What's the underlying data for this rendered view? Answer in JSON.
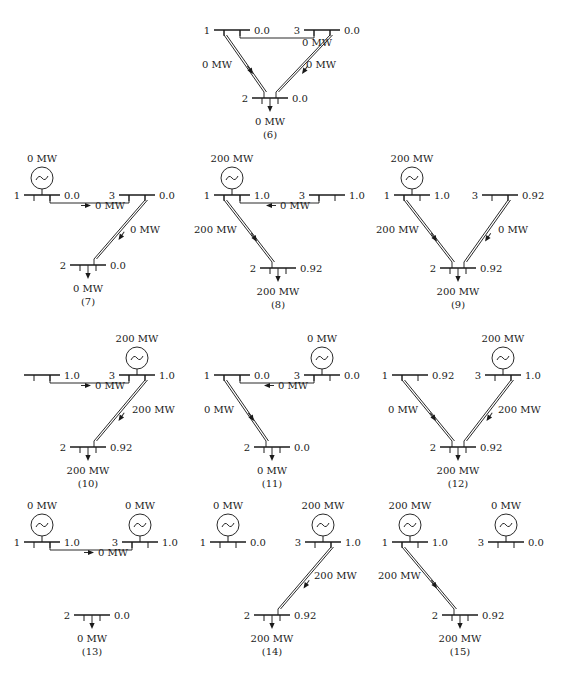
{
  "figure": {
    "colors": {
      "ink": "#1a1a1a",
      "background": "#ffffff"
    },
    "unit": "MW",
    "diagrams": [
      {
        "id": "6",
        "caption": "(6)",
        "origin": [
          190,
          0
        ],
        "buses": {
          "1": {
            "label": "1",
            "x": 42,
            "y": 30,
            "value": "0.0",
            "gen": null
          },
          "3": {
            "label": "3",
            "x": 132,
            "y": 30,
            "value": "0.0",
            "gen": null
          },
          "2": {
            "label": "2",
            "x": 80,
            "y": 98,
            "value": "0.0",
            "gen": null
          }
        },
        "load": "0 MW",
        "lines": [
          {
            "from": "1",
            "to": "3",
            "flow": "0 MW",
            "arrow": "none",
            "label_pos": [
              112,
              46
            ]
          },
          {
            "from": "1",
            "to": "2",
            "flow": "0 MW",
            "arrow": "down-right",
            "label_pos": [
              12,
              68
            ]
          },
          {
            "from": "3",
            "to": "2",
            "flow": "0 MW",
            "arrow": "down-left",
            "label_pos": [
              116,
              68
            ]
          }
        ]
      },
      {
        "id": "7",
        "caption": "(7)",
        "origin": [
          0,
          140
        ],
        "buses": {
          "1": {
            "label": "1",
            "x": 42,
            "y": 55,
            "value": "0.0",
            "gen": "0 MW"
          },
          "3": {
            "label": "3",
            "x": 137,
            "y": 55,
            "value": "0.0",
            "gen": null
          },
          "2": {
            "label": "2",
            "x": 88,
            "y": 125,
            "value": "0.0",
            "gen": null
          }
        },
        "load": "0 MW",
        "lines": [
          {
            "from": "1",
            "to": "3",
            "flow": "0 MW",
            "arrow": "right",
            "label_pos": [
              95,
              69
            ]
          },
          {
            "from": "3",
            "to": "2",
            "flow": "0 MW",
            "arrow": "down-left",
            "label_pos": [
              130,
              93
            ]
          }
        ]
      },
      {
        "id": "8",
        "caption": "(8)",
        "origin": [
          190,
          140
        ],
        "buses": {
          "1": {
            "label": "1",
            "x": 42,
            "y": 55,
            "value": "1.0",
            "gen": "200 MW"
          },
          "3": {
            "label": "3",
            "x": 137,
            "y": 55,
            "value": "1.0",
            "gen": null
          },
          "2": {
            "label": "2",
            "x": 88,
            "y": 128,
            "value": "0.92",
            "gen": null
          }
        },
        "load": "200 MW",
        "lines": [
          {
            "from": "1",
            "to": "3",
            "flow": "0 MW",
            "arrow": "left",
            "label_pos": [
              90,
              69
            ]
          },
          {
            "from": "1",
            "to": "2",
            "flow": "200 MW",
            "arrow": "down-right",
            "label_pos": [
              4,
              93
            ]
          }
        ]
      },
      {
        "id": "9",
        "caption": "(9)",
        "origin": [
          370,
          140
        ],
        "buses": {
          "1": {
            "label": "1",
            "x": 42,
            "y": 55,
            "value": "1.0",
            "gen": "200 MW"
          },
          "3": {
            "label": "3",
            "x": 130,
            "y": 55,
            "value": "0.92",
            "gen": null
          },
          "2": {
            "label": "2",
            "x": 88,
            "y": 128,
            "value": "0.92",
            "gen": null
          }
        },
        "load": "200 MW",
        "lines": [
          {
            "from": "1",
            "to": "2",
            "flow": "200 MW",
            "arrow": "down-right",
            "label_pos": [
              6,
              93
            ]
          },
          {
            "from": "3",
            "to": "2",
            "flow": "0 MW",
            "arrow": "down-left",
            "label_pos": [
              128,
              93
            ]
          }
        ]
      },
      {
        "id": "10",
        "caption": "(10)",
        "origin": [
          0,
          320
        ],
        "buses": {
          "1": {
            "label": "",
            "x": 42,
            "y": 55,
            "value": "1.0",
            "gen": null
          },
          "3": {
            "label": "3",
            "x": 137,
            "y": 55,
            "value": "1.0",
            "gen": "200 MW"
          },
          "2": {
            "label": "2",
            "x": 88,
            "y": 127,
            "value": "0.92",
            "gen": null
          }
        },
        "load": "200 MW",
        "lines": [
          {
            "from": "1",
            "to": "3",
            "flow": "0 MW",
            "arrow": "right",
            "label_pos": [
              95,
              69
            ]
          },
          {
            "from": "3",
            "to": "2",
            "flow": "200 MW",
            "arrow": "down-left",
            "label_pos": [
              132,
              93
            ]
          }
        ]
      },
      {
        "id": "11",
        "caption": "(11)",
        "origin": [
          190,
          320
        ],
        "buses": {
          "1": {
            "label": "1",
            "x": 42,
            "y": 55,
            "value": "0.0",
            "gen": null
          },
          "3": {
            "label": "3",
            "x": 132,
            "y": 55,
            "value": "0.0",
            "gen": "0 MW"
          },
          "2": {
            "label": "2",
            "x": 82,
            "y": 127,
            "value": "0.0",
            "gen": null
          }
        },
        "load": "0 MW",
        "lines": [
          {
            "from": "1",
            "to": "3",
            "flow": "0 MW",
            "arrow": "left",
            "label_pos": [
              88,
              69
            ]
          },
          {
            "from": "1",
            "to": "2",
            "flow": "0 MW",
            "arrow": "down-right",
            "label_pos": [
              14,
              93
            ]
          }
        ]
      },
      {
        "id": "12",
        "caption": "(12)",
        "origin": [
          370,
          320
        ],
        "buses": {
          "1": {
            "label": "1",
            "x": 40,
            "y": 55,
            "value": "0.92",
            "gen": null
          },
          "3": {
            "label": "3",
            "x": 133,
            "y": 55,
            "value": "1.0",
            "gen": "200 MW"
          },
          "2": {
            "label": "2",
            "x": 88,
            "y": 127,
            "value": "0.92",
            "gen": null
          }
        },
        "load": "200 MW",
        "lines": [
          {
            "from": "1",
            "to": "2",
            "flow": "0 MW",
            "arrow": "down-right",
            "label_pos": [
              18,
              93
            ]
          },
          {
            "from": "3",
            "to": "2",
            "flow": "200 MW",
            "arrow": "down-left",
            "label_pos": [
              128,
              93
            ]
          }
        ]
      },
      {
        "id": "13",
        "caption": "(13)",
        "origin": [
          0,
          495
        ],
        "buses": {
          "1": {
            "label": "1",
            "x": 42,
            "y": 47,
            "value": "1.0",
            "gen": "0 MW"
          },
          "3": {
            "label": "3",
            "x": 140,
            "y": 47,
            "value": "1.0",
            "gen": "0 MW"
          },
          "2": {
            "label": "2",
            "x": 92,
            "y": 120,
            "value": "0.0",
            "gen": null
          }
        },
        "load": "0 MW",
        "lines": [
          {
            "from": "1",
            "to": "3",
            "flow": "0 MW",
            "arrow": "right",
            "label_pos": [
              98,
              61
            ]
          }
        ]
      },
      {
        "id": "14",
        "caption": "(14)",
        "origin": [
          190,
          495
        ],
        "buses": {
          "1": {
            "label": "1",
            "x": 38,
            "y": 47,
            "value": "0.0",
            "gen": "0 MW"
          },
          "3": {
            "label": "3",
            "x": 133,
            "y": 47,
            "value": "1.0",
            "gen": "200 MW"
          },
          "2": {
            "label": "2",
            "x": 82,
            "y": 120,
            "value": "0.92",
            "gen": null
          }
        },
        "load": "200 MW",
        "lines": [
          {
            "from": "3",
            "to": "2",
            "flow": "200 MW",
            "arrow": "down-left",
            "label_pos": [
              124,
              84
            ]
          }
        ]
      },
      {
        "id": "15",
        "caption": "(15)",
        "origin": [
          370,
          495
        ],
        "buses": {
          "1": {
            "label": "1",
            "x": 40,
            "y": 47,
            "value": "1.0",
            "gen": "200 MW"
          },
          "3": {
            "label": "3",
            "x": 136,
            "y": 47,
            "value": "0.0",
            "gen": "0 MW"
          },
          "2": {
            "label": "2",
            "x": 90,
            "y": 120,
            "value": "0.92",
            "gen": null
          }
        },
        "load": "200 MW",
        "lines": [
          {
            "from": "1",
            "to": "2",
            "flow": "200 MW",
            "arrow": "down-right",
            "label_pos": [
              8,
              84
            ]
          }
        ]
      }
    ]
  }
}
